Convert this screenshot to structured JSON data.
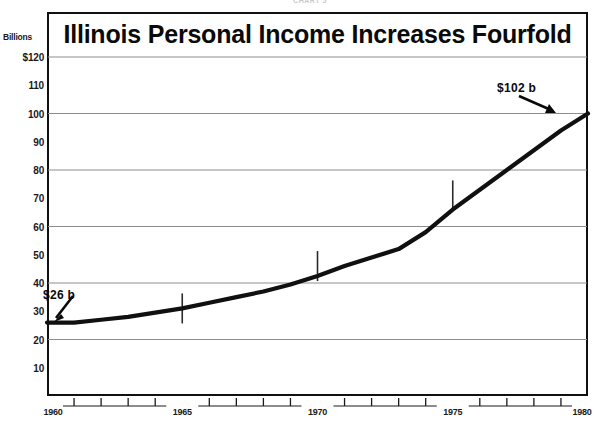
{
  "figure": {
    "scan_artifact_text": "CHART 5",
    "background_color": "#ffffff",
    "line_color": "#101010",
    "grid_color": "#8d8d8d",
    "frame_color": "#101010"
  },
  "chart_data": {
    "type": "line",
    "title": "Illinois Personal Income Increases Fourfold",
    "xlabel": "",
    "ylabel": "Billions",
    "ylim": [
      0,
      120
    ],
    "xlim": [
      1960,
      1980
    ],
    "grid": true,
    "legend_position": "none",
    "y_unit_label": "Billions",
    "y_ticks": [
      120,
      110,
      100,
      90,
      80,
      70,
      60,
      50,
      40,
      30,
      20,
      10
    ],
    "y_tick_labels": [
      "$120",
      "110",
      "100",
      "90",
      "80",
      "70",
      "60",
      "50",
      "40",
      "30",
      "20",
      "10"
    ],
    "y_gridlines": [
      120,
      100,
      80,
      60,
      40,
      20
    ],
    "x_ticks": [
      1960,
      1965,
      1970,
      1975,
      1980
    ],
    "x_tick_labels": [
      "1960",
      "1965",
      "1970",
      "1975",
      "1980"
    ],
    "x_minor_ticks": [
      1961,
      1962,
      1963,
      1964,
      1966,
      1967,
      1968,
      1969,
      1971,
      1972,
      1973,
      1974,
      1976,
      1977,
      1978,
      1979
    ],
    "x": [
      1960,
      1961,
      1962,
      1963,
      1964,
      1965,
      1966,
      1967,
      1968,
      1969,
      1970,
      1971,
      1972,
      1973,
      1974,
      1975,
      1976,
      1977,
      1978,
      1979,
      1980
    ],
    "values": [
      26,
      26,
      27,
      28,
      29.5,
      31,
      33,
      35,
      37,
      39.5,
      42.5,
      46,
      49,
      52,
      58,
      66,
      73,
      80,
      87,
      94,
      100
    ],
    "markers": [
      {
        "x": 1965,
        "y": 31
      },
      {
        "x": 1970,
        "y": 46
      },
      {
        "x": 1975,
        "y": 71
      }
    ],
    "annotations": [
      {
        "text": "$26 b",
        "x": 1960,
        "y": 26,
        "label_position": "above-right"
      },
      {
        "text": "$102 b",
        "x": 1980,
        "y": 100,
        "label_position": "above-left"
      }
    ]
  }
}
